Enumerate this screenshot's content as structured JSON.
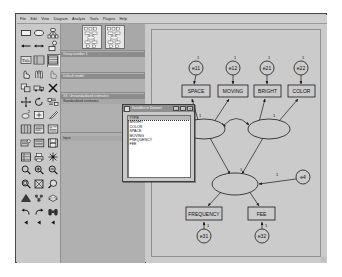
{
  "window": {
    "title": "Amos Graphics"
  },
  "menubar": {
    "items": [
      {
        "label": "File",
        "mnemonic": "F"
      },
      {
        "label": "Edit",
        "mnemonic": "E"
      },
      {
        "label": "View",
        "mnemonic": "V"
      },
      {
        "label": "Diagram",
        "mnemonic": "D"
      },
      {
        "label": "Analyze",
        "mnemonic": "A"
      },
      {
        "label": "Tools",
        "mnemonic": "T"
      },
      {
        "label": "Plugins",
        "mnemonic": "P"
      },
      {
        "label": "Help",
        "mnemonic": "H"
      }
    ]
  },
  "palette": {
    "tools": [
      {
        "name": "draw-observed-variable-icon",
        "glyph": "rectangle"
      },
      {
        "name": "draw-unobserved-variable-icon",
        "glyph": "ellipse"
      },
      {
        "name": "draw-latent-with-indicators-icon",
        "glyph": "latent-indicators"
      },
      {
        "name": "draw-path-icon",
        "glyph": "arrow-single"
      },
      {
        "name": "draw-covariance-icon",
        "glyph": "arrow-double"
      },
      {
        "name": "add-unique-variable-icon",
        "glyph": "error-term"
      },
      {
        "name": "figure-caption-icon",
        "glyph": "title-text"
      },
      {
        "name": "list-variables-in-model-icon",
        "glyph": "list-model"
      },
      {
        "name": "list-variables-in-dataset-icon",
        "glyph": "list-dataset",
        "selected": true
      },
      {
        "name": "select-one-object-icon",
        "glyph": "hand-point"
      },
      {
        "name": "select-all-objects-icon",
        "glyph": "hand-all"
      },
      {
        "name": "deselect-all-objects-icon",
        "glyph": "hand-none"
      },
      {
        "name": "duplicate-objects-icon",
        "glyph": "copy"
      },
      {
        "name": "move-objects-icon",
        "glyph": "truck"
      },
      {
        "name": "erase-objects-icon",
        "glyph": "x-erase"
      },
      {
        "name": "change-shape-icon",
        "glyph": "resize"
      },
      {
        "name": "rotate-indicators-icon",
        "glyph": "rotate"
      },
      {
        "name": "reflect-indicators-icon",
        "glyph": "reflect"
      },
      {
        "name": "move-parameter-values-icon",
        "glyph": "move-param"
      },
      {
        "name": "scroll-diagram-icon",
        "glyph": "scroll"
      },
      {
        "name": "touch-up-variable-icon",
        "glyph": "touch-up"
      },
      {
        "name": "select-data-file-icon",
        "glyph": "data-file"
      },
      {
        "name": "analysis-properties-icon",
        "glyph": "analysis-props"
      },
      {
        "name": "object-properties-icon",
        "glyph": "object-props"
      },
      {
        "name": "preserve-symmetries-icon",
        "glyph": "symmetry"
      },
      {
        "name": "view-output-icon",
        "glyph": "output-view"
      },
      {
        "name": "save-diagram-icon",
        "glyph": "save-disk"
      },
      {
        "name": "copy-to-clipboard-icon",
        "glyph": "clipboard"
      },
      {
        "name": "print-icon",
        "glyph": "printer"
      },
      {
        "name": "multiple-group-analysis-icon",
        "glyph": "groups"
      },
      {
        "name": "zoom-icon",
        "glyph": "magnifier"
      },
      {
        "name": "zoom-in-icon",
        "glyph": "magnifier-plus"
      },
      {
        "name": "zoom-out-icon",
        "glyph": "magnifier-minus"
      },
      {
        "name": "zoom-page-icon",
        "glyph": "magnifier-page"
      },
      {
        "name": "fit-to-page-icon",
        "glyph": "fit-page"
      },
      {
        "name": "loupe-icon",
        "glyph": "loupe"
      },
      {
        "name": "bayesian-estimation-icon",
        "glyph": "bayes"
      },
      {
        "name": "multiple-groups-icon",
        "glyph": "multi-group"
      },
      {
        "name": "print-preview-icon",
        "glyph": "stack"
      },
      {
        "name": "undo-icon",
        "glyph": "undo-arrow"
      },
      {
        "name": "redo-icon",
        "glyph": "redo-arrow"
      },
      {
        "name": "search-icon",
        "glyph": "binoculars"
      }
    ],
    "footer_tools": [
      {
        "name": "scroll-left-icon",
        "glyph": "triangle-left"
      },
      {
        "name": "scroll-mid-icon",
        "glyph": "triangle-left"
      },
      {
        "name": "scroll-right-icon",
        "glyph": "triangle-left"
      }
    ]
  },
  "models_panel": {
    "group_header": "Group number 1",
    "models_header": "Default model",
    "computation_header": "XX: Unstandardized estimates",
    "computation_row": "Standardized estimates",
    "files_header": "Input"
  },
  "variables_dialog": {
    "title": "Variables in Dataset",
    "buttons": [
      "–",
      "□",
      "✕"
    ],
    "variables": [
      {
        "label": "TYPE",
        "selected": true
      },
      {
        "label": "BRIGHT",
        "selected": false
      },
      {
        "label": "COLOR",
        "selected": false
      },
      {
        "label": "SPACE",
        "selected": false
      },
      {
        "label": "MOVING",
        "selected": false
      },
      {
        "label": "FREQUENCY",
        "selected": false
      },
      {
        "label": "FEE",
        "selected": false
      }
    ]
  },
  "diagram": {
    "type": "path-diagram",
    "observed_variables": [
      {
        "id": "SPACE",
        "label": "SPACE",
        "x": 36,
        "y": 62,
        "w": 28,
        "h": 11
      },
      {
        "id": "MOVING",
        "label": "MOVING",
        "x": 73,
        "y": 62,
        "w": 28,
        "h": 11
      },
      {
        "id": "BRIGHT",
        "label": "BRIGHT",
        "x": 108,
        "y": 62,
        "w": 26,
        "h": 11
      },
      {
        "id": "COLOR",
        "label": "COLOR",
        "x": 142,
        "y": 62,
        "w": 26,
        "h": 11
      },
      {
        "id": "FREQUENCY",
        "label": "FREQUENCY",
        "x": 42,
        "y": 185,
        "w": 32,
        "h": 12
      },
      {
        "id": "FEE",
        "label": "FEE",
        "x": 104,
        "y": 185,
        "w": 24,
        "h": 12
      }
    ],
    "error_terms": [
      {
        "id": "e11",
        "label": "e11",
        "cx": 50,
        "cy": 44,
        "r": 7,
        "param": "1"
      },
      {
        "id": "e12",
        "label": "e12",
        "cx": 87,
        "cy": 44,
        "r": 7,
        "param": "1"
      },
      {
        "id": "e21",
        "label": "e21",
        "cx": 121,
        "cy": 44,
        "r": 7,
        "param": "1"
      },
      {
        "id": "e22",
        "label": "e22",
        "cx": 155,
        "cy": 44,
        "r": 7,
        "param": "1"
      },
      {
        "id": "e31",
        "label": "e31",
        "cx": 58,
        "cy": 212,
        "r": 7,
        "param": "1"
      },
      {
        "id": "e32",
        "label": "e32",
        "cx": 116,
        "cy": 212,
        "r": 7,
        "param": "1"
      },
      {
        "id": "e4",
        "label": "e4",
        "cx": 157,
        "cy": 153,
        "r": 7,
        "param": "1"
      }
    ],
    "latent_variables": [
      {
        "id": "F1",
        "label": "",
        "cx": 58,
        "cy": 105,
        "rx": 21,
        "ry": 10,
        "param": "1"
      },
      {
        "id": "F2",
        "label": "",
        "cx": 123,
        "cy": 105,
        "rx": 21,
        "ry": 10,
        "param": "1"
      },
      {
        "id": "F3",
        "label": "",
        "cx": 89,
        "cy": 160,
        "rx": 23,
        "ry": 11,
        "param": "1"
      }
    ],
    "covariances": [
      {
        "from": "F1",
        "to": "F2",
        "label": ""
      }
    ],
    "path_labels": [
      "1",
      "1",
      "1",
      "1",
      "1",
      "1",
      "1"
    ]
  }
}
